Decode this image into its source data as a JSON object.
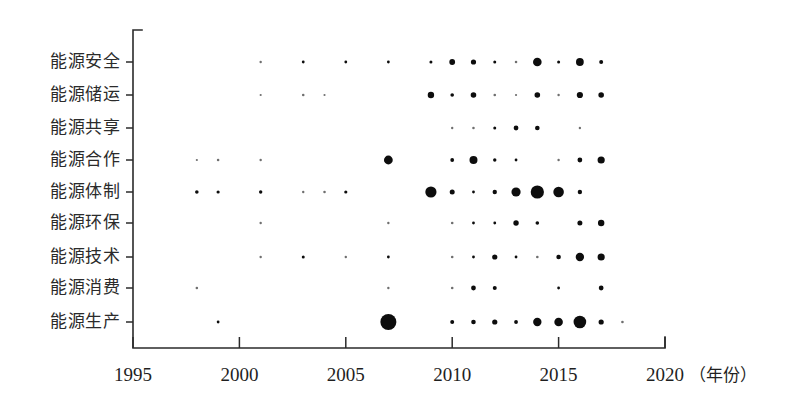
{
  "chart_data": {
    "type": "scatter",
    "title": "",
    "subtitle": "",
    "xlabel": "年份",
    "ylabel": "",
    "xlim": [
      1995,
      2020
    ],
    "ylim": [
      0,
      10
    ],
    "grid": false,
    "legend": null,
    "x_unit_label": "（年份）",
    "x_ticks": [
      1995,
      2000,
      2005,
      2010,
      2015,
      2020
    ],
    "x_tick_labels": [
      "1995",
      "2000",
      "2005",
      "2010",
      "2015",
      "2020"
    ],
    "categories": [
      "能源安全",
      "能源储运",
      "能源共享",
      "能源合作",
      "能源体制",
      "能源环保",
      "能源技术",
      "能源消费",
      "能源生产"
    ],
    "size_note": "bubble radius encodes frequency; r in pixels",
    "series": [
      {
        "name": "能源安全",
        "points": [
          {
            "x": 2001,
            "r": 1.2
          },
          {
            "x": 2003,
            "r": 1.4
          },
          {
            "x": 2005,
            "r": 1.4
          },
          {
            "x": 2007,
            "r": 1.4
          },
          {
            "x": 2009,
            "r": 1.5
          },
          {
            "x": 2010,
            "r": 2.9
          },
          {
            "x": 2011,
            "r": 2.6
          },
          {
            "x": 2012,
            "r": 1.5
          },
          {
            "x": 2013,
            "r": 1.3
          },
          {
            "x": 2014,
            "r": 4.3
          },
          {
            "x": 2015,
            "r": 1.5
          },
          {
            "x": 2016,
            "r": 3.9
          },
          {
            "x": 2017,
            "r": 2.0
          }
        ]
      },
      {
        "name": "能源储运",
        "points": [
          {
            "x": 2001,
            "r": 1.1
          },
          {
            "x": 2003,
            "r": 1.3
          },
          {
            "x": 2004,
            "r": 1.1
          },
          {
            "x": 2009,
            "r": 3.2
          },
          {
            "x": 2010,
            "r": 1.8
          },
          {
            "x": 2011,
            "r": 2.8
          },
          {
            "x": 2012,
            "r": 1.3
          },
          {
            "x": 2013,
            "r": 1.1
          },
          {
            "x": 2014,
            "r": 2.8
          },
          {
            "x": 2015,
            "r": 1.2
          },
          {
            "x": 2016,
            "r": 3.1
          },
          {
            "x": 2017,
            "r": 2.8
          }
        ]
      },
      {
        "name": "能源共享",
        "points": [
          {
            "x": 2010,
            "r": 1.2
          },
          {
            "x": 2011,
            "r": 1.3
          },
          {
            "x": 2012,
            "r": 1.5
          },
          {
            "x": 2013,
            "r": 2.4
          },
          {
            "x": 2014,
            "r": 2.3
          },
          {
            "x": 2016,
            "r": 1.2
          }
        ]
      },
      {
        "name": "能源合作",
        "points": [
          {
            "x": 1998,
            "r": 1.1
          },
          {
            "x": 1999,
            "r": 1.3
          },
          {
            "x": 2001,
            "r": 1.2
          },
          {
            "x": 2007,
            "r": 4.4
          },
          {
            "x": 2010,
            "r": 1.9
          },
          {
            "x": 2011,
            "r": 4.0
          },
          {
            "x": 2012,
            "r": 1.7
          },
          {
            "x": 2013,
            "r": 1.4
          },
          {
            "x": 2015,
            "r": 1.2
          },
          {
            "x": 2016,
            "r": 2.4
          },
          {
            "x": 2017,
            "r": 3.6
          }
        ]
      },
      {
        "name": "能源体制",
        "points": [
          {
            "x": 1998,
            "r": 1.8
          },
          {
            "x": 1999,
            "r": 1.6
          },
          {
            "x": 2001,
            "r": 1.7
          },
          {
            "x": 2003,
            "r": 1.2
          },
          {
            "x": 2004,
            "r": 1.3
          },
          {
            "x": 2005,
            "r": 1.6
          },
          {
            "x": 2009,
            "r": 5.6
          },
          {
            "x": 2010,
            "r": 2.5
          },
          {
            "x": 2011,
            "r": 1.4
          },
          {
            "x": 2012,
            "r": 2.2
          },
          {
            "x": 2013,
            "r": 4.6
          },
          {
            "x": 2014,
            "r": 6.6
          },
          {
            "x": 2015,
            "r": 5.3
          },
          {
            "x": 2016,
            "r": 2.2
          }
        ]
      },
      {
        "name": "能源环保",
        "points": [
          {
            "x": 2001,
            "r": 1.2
          },
          {
            "x": 2007,
            "r": 1.2
          },
          {
            "x": 2010,
            "r": 1.3
          },
          {
            "x": 2011,
            "r": 1.4
          },
          {
            "x": 2012,
            "r": 1.4
          },
          {
            "x": 2013,
            "r": 2.7
          },
          {
            "x": 2014,
            "r": 1.8
          },
          {
            "x": 2016,
            "r": 2.5
          },
          {
            "x": 2017,
            "r": 3.2
          }
        ]
      },
      {
        "name": "能源技术",
        "points": [
          {
            "x": 2001,
            "r": 1.2
          },
          {
            "x": 2003,
            "r": 1.5
          },
          {
            "x": 2005,
            "r": 1.2
          },
          {
            "x": 2007,
            "r": 1.4
          },
          {
            "x": 2010,
            "r": 1.3
          },
          {
            "x": 2011,
            "r": 1.4
          },
          {
            "x": 2012,
            "r": 2.6
          },
          {
            "x": 2013,
            "r": 1.4
          },
          {
            "x": 2014,
            "r": 1.3
          },
          {
            "x": 2015,
            "r": 2.3
          },
          {
            "x": 2016,
            "r": 4.2
          },
          {
            "x": 2017,
            "r": 3.6
          }
        ]
      },
      {
        "name": "能源消费",
        "points": [
          {
            "x": 1998,
            "r": 1.3
          },
          {
            "x": 2007,
            "r": 1.2
          },
          {
            "x": 2010,
            "r": 1.3
          },
          {
            "x": 2011,
            "r": 2.4
          },
          {
            "x": 2012,
            "r": 2.0
          },
          {
            "x": 2015,
            "r": 1.4
          },
          {
            "x": 2017,
            "r": 2.4
          }
        ]
      },
      {
        "name": "能源生产",
        "points": [
          {
            "x": 1999,
            "r": 1.4
          },
          {
            "x": 2007,
            "r": 8.0
          },
          {
            "x": 2010,
            "r": 2.0
          },
          {
            "x": 2011,
            "r": 2.3
          },
          {
            "x": 2012,
            "r": 2.6
          },
          {
            "x": 2013,
            "r": 1.9
          },
          {
            "x": 2014,
            "r": 4.2
          },
          {
            "x": 2015,
            "r": 4.3
          },
          {
            "x": 2016,
            "r": 6.3
          },
          {
            "x": 2017,
            "r": 2.6
          },
          {
            "x": 2018,
            "r": 1.3
          }
        ]
      }
    ]
  },
  "geometry": {
    "axis_x_start_px": 133,
    "axis_x_end_px": 665,
    "axis_y_top_px": 30,
    "axis_y_bottom_px": 348,
    "row_y_px": [
      62,
      95,
      128,
      160,
      192,
      223,
      257,
      288,
      322
    ]
  },
  "colors": {
    "bubble": "#0d0d0d",
    "axis": "#2b2b2b",
    "label": "#2b2b2b",
    "background": "#ffffff"
  }
}
